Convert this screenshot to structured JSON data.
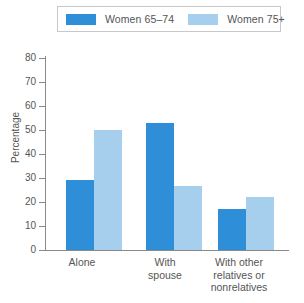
{
  "legend": {
    "entries": [
      {
        "label": "Women 65–74",
        "color": "#2e8fd8",
        "swatch_name": "legend-swatch-women-65-74"
      },
      {
        "label": "Women 75+",
        "color": "#a6cfee",
        "swatch_name": "legend-swatch-women-75-plus"
      }
    ]
  },
  "axis": {
    "y_title": "Percentage",
    "y_ticks": [
      "0",
      "10",
      "20",
      "30",
      "40",
      "50",
      "60",
      "70",
      "80"
    ]
  },
  "chart_data": {
    "type": "bar",
    "title": "",
    "subtitle": "",
    "xlabel": "",
    "ylabel": "Percentage",
    "categories": [
      "Alone",
      "With\nspouse",
      "With other\nrelatives or\nnonrelatives"
    ],
    "series": [
      {
        "name": "Women 65–74",
        "color": "#2e8fd8",
        "values": [
          29,
          53,
          17
        ]
      },
      {
        "name": "Women 75+",
        "color": "#a6cfee",
        "values": [
          50,
          26.5,
          22
        ]
      }
    ],
    "ylim": [
      0,
      80
    ],
    "ytick_step": 10,
    "grid": false,
    "legend_position": "top"
  }
}
